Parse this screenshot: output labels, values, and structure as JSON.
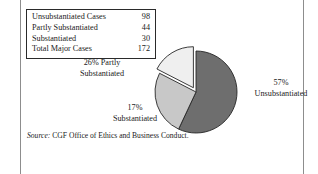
{
  "figure": {
    "background_color": "#ffffff",
    "rule_color": "#8d8d8d"
  },
  "table": {
    "border_color": "#2a2a2a",
    "columns": [
      "Category",
      "Count"
    ],
    "rows": [
      {
        "label": "Unsubstantiated Cases",
        "value": "98"
      },
      {
        "label": "Partly Substantiated",
        "value": "44"
      },
      {
        "label": "Substantiated",
        "value": "30"
      },
      {
        "label": "Total Major Cases",
        "value": "172"
      }
    ]
  },
  "labels": {
    "partly": {
      "line1": "26% Partly",
      "line2": "Substantiated"
    },
    "unsubstantiated": {
      "line1": "57%",
      "line2": "Unsubstantiated"
    },
    "substantiated": {
      "line1": "17%",
      "line2": "Substantiated"
    }
  },
  "source": {
    "prefix": "Source:",
    "text": "CGF Office of Ethics and Business Conduct."
  },
  "chart_data": {
    "type": "pie",
    "title": "",
    "categories": [
      "Unsubstantiated",
      "Partly Substantiated",
      "Substantiated"
    ],
    "values": [
      98,
      44,
      30
    ],
    "percentages": [
      57,
      26,
      17
    ],
    "total": 172,
    "colors": [
      "#6e6e6e",
      "#c8c8c8",
      "#efefef"
    ],
    "slice_outline_color": "#262626",
    "exploded_slices": [
      "Substantiated"
    ],
    "start_angle_deg": 0,
    "direction": "clockwise",
    "legend": "none",
    "data_labels": [
      "57% Unsubstantiated",
      "26% Partly Substantiated",
      "17% Substantiated"
    ]
  }
}
